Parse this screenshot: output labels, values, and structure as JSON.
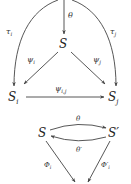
{
  "diagram_top": {
    "nodes": {
      "center": {
        "label": "S",
        "sub": ""
      },
      "left": {
        "label": "S",
        "sub": "i"
      },
      "right": {
        "label": "S",
        "sub": "j"
      }
    },
    "edges": {
      "theta": {
        "label": "θ",
        "from": "top",
        "to": "center"
      },
      "tau_i": {
        "label": "τ",
        "sub": "i",
        "from": "top",
        "to": "left"
      },
      "tau_j": {
        "label": "τ",
        "sub": "j",
        "from": "top",
        "to": "right"
      },
      "psi_i": {
        "label": "ψ",
        "sub": "i",
        "from": "center",
        "to": "left"
      },
      "psi_j": {
        "label": "ψ",
        "sub": "j",
        "from": "center",
        "to": "right"
      },
      "psi_ij": {
        "label": "ψ",
        "sub": "i,j",
        "from": "left",
        "to": "right"
      }
    }
  },
  "diagram_bottom": {
    "nodes": {
      "left": {
        "label": "S"
      },
      "right": {
        "label": "S′"
      }
    },
    "edges": {
      "theta": {
        "label": "θ",
        "from": "left",
        "to": "right"
      },
      "theta_prime": {
        "label": "θ′",
        "from": "right",
        "to": "left"
      },
      "phi_i": {
        "label": "Φ",
        "sub": "i",
        "from": "left",
        "to": "bottom"
      },
      "phi_prime_i": {
        "label": "Φ′",
        "sub": "i",
        "from": "right",
        "to": "bottom"
      }
    }
  },
  "colors": {
    "stroke": "#444444",
    "text": "#222222",
    "background": "#ffffff"
  }
}
